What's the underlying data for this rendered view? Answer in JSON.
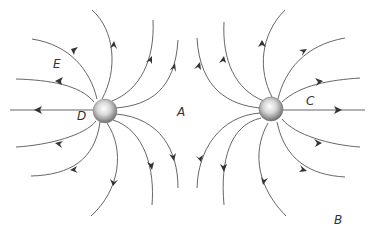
{
  "diagram": {
    "charges": [
      {
        "id": "left",
        "cx": 105,
        "cy": 111,
        "r": 12
      },
      {
        "id": "right",
        "cx": 271,
        "cy": 109,
        "r": 12
      }
    ],
    "labels": {
      "A": {
        "text": "A",
        "x": 177,
        "y": 106
      },
      "B": {
        "text": "B",
        "x": 334,
        "y": 214
      },
      "C": {
        "text": "C",
        "x": 306,
        "y": 95
      },
      "D": {
        "text": "D",
        "x": 77,
        "y": 110
      },
      "E": {
        "text": "E",
        "x": 53,
        "y": 58
      }
    },
    "colors": {
      "line": "#555555",
      "arrow": "#333333",
      "charge_light": "#f8f8f8",
      "charge_dark": "#7a7a7a"
    }
  }
}
